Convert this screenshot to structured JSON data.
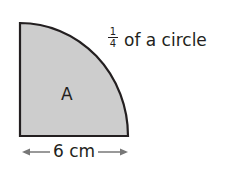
{
  "shape": {
    "type": "quarter-circle",
    "fill": "#cdcdcd",
    "stroke": "#231f20",
    "region_label": "A"
  },
  "annotation": {
    "fraction_numerator": "1",
    "fraction_denominator": "4",
    "text": "of a circle"
  },
  "dimension": {
    "label": "6 cm",
    "arrow_icon": "double-headed-arrow"
  }
}
